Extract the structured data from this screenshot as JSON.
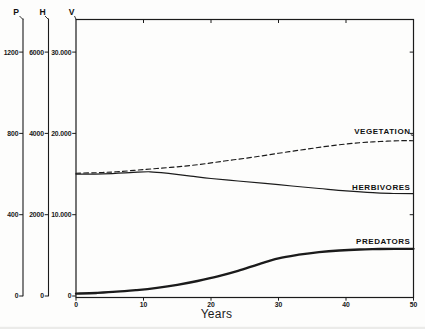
{
  "figure": {
    "background": "#fdfdfc",
    "line_color": "#1b1b1b"
  },
  "curve_labels": {
    "vegetation": "VEGETATION",
    "herbivores": "HERBIVORES",
    "predators": "PREDATORS"
  },
  "chart_data": {
    "type": "line",
    "title": "",
    "xlabel": "Years",
    "x_range": [
      0,
      50
    ],
    "x_ticks": [
      0,
      10,
      20,
      30,
      40,
      50
    ],
    "x_tick_labels": [
      "0",
      "10",
      "20",
      "30",
      "40",
      "50"
    ],
    "grid": false,
    "legend_position": "inline-right",
    "axes": [
      {
        "id": "P",
        "label": "P",
        "range": [
          0,
          1365
        ],
        "tick_values": [
          0,
          400,
          800,
          1200
        ],
        "tick_labels": [
          "0",
          "400",
          "800",
          "1200"
        ]
      },
      {
        "id": "H",
        "label": "H",
        "range": [
          0,
          6825
        ],
        "tick_values": [
          0,
          2000,
          4000,
          6000
        ],
        "tick_labels": [
          "0",
          "2000",
          "4000",
          "6000"
        ]
      },
      {
        "id": "V",
        "label": "V",
        "range": [
          0,
          34100
        ],
        "tick_values": [
          0,
          10000,
          20000,
          30000
        ],
        "tick_labels": [
          "0",
          "10.000",
          "20.000",
          "30.000"
        ]
      }
    ],
    "series": [
      {
        "name": "VEGETATION",
        "axis": "V",
        "style": "dashed",
        "points": [
          [
            0,
            15100
          ],
          [
            3,
            15170
          ],
          [
            6,
            15280
          ],
          [
            10,
            15550
          ],
          [
            14,
            15820
          ],
          [
            18,
            16150
          ],
          [
            22,
            16600
          ],
          [
            26,
            17050
          ],
          [
            30,
            17550
          ],
          [
            34,
            18050
          ],
          [
            38,
            18500
          ],
          [
            42,
            18850
          ],
          [
            45,
            19000
          ],
          [
            48,
            19100
          ],
          [
            50,
            19100
          ]
        ]
      },
      {
        "name": "HERBIVORES",
        "axis": "H",
        "style": "solid",
        "points": [
          [
            0,
            3000
          ],
          [
            4,
            3005
          ],
          [
            8,
            3035
          ],
          [
            11,
            3055
          ],
          [
            14,
            3010
          ],
          [
            17,
            2950
          ],
          [
            20,
            2890
          ],
          [
            24,
            2830
          ],
          [
            28,
            2770
          ],
          [
            32,
            2705
          ],
          [
            36,
            2645
          ],
          [
            40,
            2585
          ],
          [
            44,
            2540
          ],
          [
            47,
            2522
          ],
          [
            50,
            2518
          ]
        ]
      },
      {
        "name": "PREDATORS",
        "axis": "P",
        "style": "solid-thick",
        "points": [
          [
            0,
            12
          ],
          [
            3,
            15
          ],
          [
            6,
            21
          ],
          [
            9,
            29
          ],
          [
            12,
            40
          ],
          [
            15,
            55
          ],
          [
            18,
            74
          ],
          [
            21,
            97
          ],
          [
            24,
            124
          ],
          [
            27,
            156
          ],
          [
            30,
            185
          ],
          [
            33,
            203
          ],
          [
            36,
            216
          ],
          [
            39,
            224
          ],
          [
            42,
            229
          ],
          [
            45,
            231
          ],
          [
            50,
            232
          ]
        ]
      }
    ]
  }
}
